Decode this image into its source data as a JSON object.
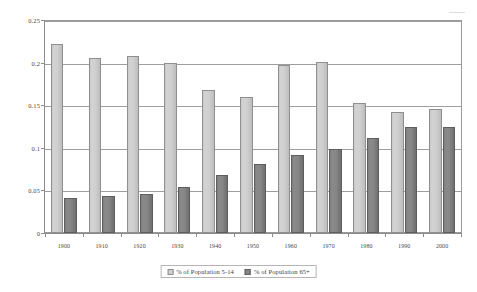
{
  "chart_data": {
    "type": "bar",
    "title": "",
    "subtitle": "",
    "xlabel": "",
    "ylabel": "",
    "categories": [
      "1900",
      "1910",
      "1920",
      "1930",
      "1940",
      "1950",
      "1960",
      "1970",
      "1980",
      "1990",
      "2000"
    ],
    "series": [
      {
        "name": "% of Population 5-14",
        "color": "#cfcfcf",
        "values": [
          0.222,
          0.205,
          0.208,
          0.2,
          0.168,
          0.16,
          0.197,
          0.201,
          0.153,
          0.142,
          0.145
        ]
      },
      {
        "name": "% of Population 65+",
        "color": "#868686",
        "values": [
          0.041,
          0.043,
          0.046,
          0.054,
          0.068,
          0.081,
          0.092,
          0.099,
          0.112,
          0.125,
          0.124
        ]
      }
    ],
    "ylim": [
      0,
      0.25
    ],
    "yticks": [
      "0",
      "0.05",
      "0.1",
      "0.15",
      "0.2",
      "0.25"
    ],
    "ytick_values": [
      0,
      0.05,
      0.1,
      0.15,
      0.2,
      0.25
    ],
    "grid": true,
    "legend_position": "bottom",
    "legend": [
      "% of Population 5-14",
      "% of Population 65+"
    ]
  }
}
